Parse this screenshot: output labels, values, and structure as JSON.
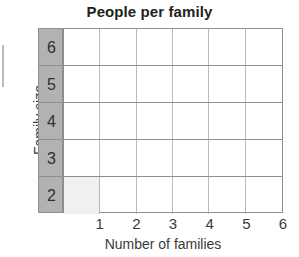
{
  "chart_data": {
    "type": "bar",
    "orientation": "horizontal",
    "title": "People per family",
    "xlabel": "Number of families",
    "ylabel": "Family size",
    "categories": [
      "6",
      "5",
      "4",
      "3",
      "2"
    ],
    "values": [
      0,
      0,
      0,
      0,
      1
    ],
    "x_ticks": [
      "1",
      "2",
      "3",
      "4",
      "5",
      "6"
    ],
    "xlim": [
      0,
      6
    ],
    "grid": true,
    "legend": false,
    "columns": 6,
    "rows": 5,
    "colors": {
      "row_label_background": "#b2b2b2",
      "bar_fill": "#f0f0ef",
      "grid_line": "#8e8e8e",
      "cell_divider": "#b9b9b9",
      "plot_background": "#ffffff",
      "text": "#3a3a3a",
      "title_text": "#231f20"
    },
    "rows_detail": [
      {
        "label": "6",
        "value": 0,
        "cells": [
          false,
          false,
          false,
          false,
          false,
          false
        ]
      },
      {
        "label": "5",
        "value": 0,
        "cells": [
          false,
          false,
          false,
          false,
          false,
          false
        ]
      },
      {
        "label": "4",
        "value": 0,
        "cells": [
          false,
          false,
          false,
          false,
          false,
          false
        ]
      },
      {
        "label": "3",
        "value": 0,
        "cells": [
          false,
          false,
          false,
          false,
          false,
          false
        ]
      },
      {
        "label": "2",
        "value": 1,
        "cells": [
          true,
          false,
          false,
          false,
          false,
          false
        ]
      }
    ]
  }
}
